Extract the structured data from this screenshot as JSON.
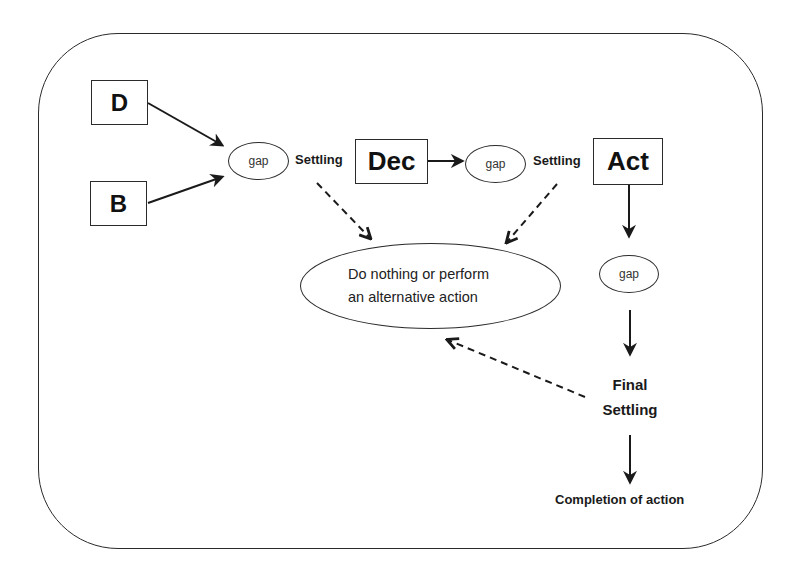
{
  "diagram": {
    "nodes": {
      "d": {
        "label": "D"
      },
      "b": {
        "label": "B"
      },
      "gap1": {
        "label": "gap"
      },
      "settling1": {
        "label": "Settling"
      },
      "dec": {
        "label": "Dec"
      },
      "gap2": {
        "label": "gap"
      },
      "settling2": {
        "label": "Settling"
      },
      "act": {
        "label": "Act"
      },
      "gap3": {
        "label": "gap"
      },
      "alternative": {
        "line1": "Do nothing or perform",
        "line2": "an alternative action"
      },
      "final_settling": {
        "line1": "Final",
        "line2": "Settling"
      },
      "completion": {
        "label": "Completion of action"
      }
    },
    "edges": [
      {
        "from": "D",
        "to": "gap1",
        "style": "solid"
      },
      {
        "from": "B",
        "to": "gap1",
        "style": "solid"
      },
      {
        "from": "Dec",
        "to": "gap2",
        "style": "solid"
      },
      {
        "from": "Act",
        "to": "gap3",
        "style": "solid"
      },
      {
        "from": "gap3",
        "to": "Final Settling",
        "style": "solid"
      },
      {
        "from": "Final Settling",
        "to": "Completion of action",
        "style": "solid"
      },
      {
        "from": "Settling (1)",
        "to": "Do nothing or perform an alternative action",
        "style": "dashed"
      },
      {
        "from": "Settling (2)",
        "to": "Do nothing or perform an alternative action",
        "style": "dashed"
      },
      {
        "from": "Final Settling",
        "to": "Do nothing or perform an alternative action",
        "style": "dashed"
      }
    ],
    "colors": {
      "stroke": "#2b2b2b",
      "text": "#1a1a1a",
      "background": "#ffffff"
    }
  }
}
